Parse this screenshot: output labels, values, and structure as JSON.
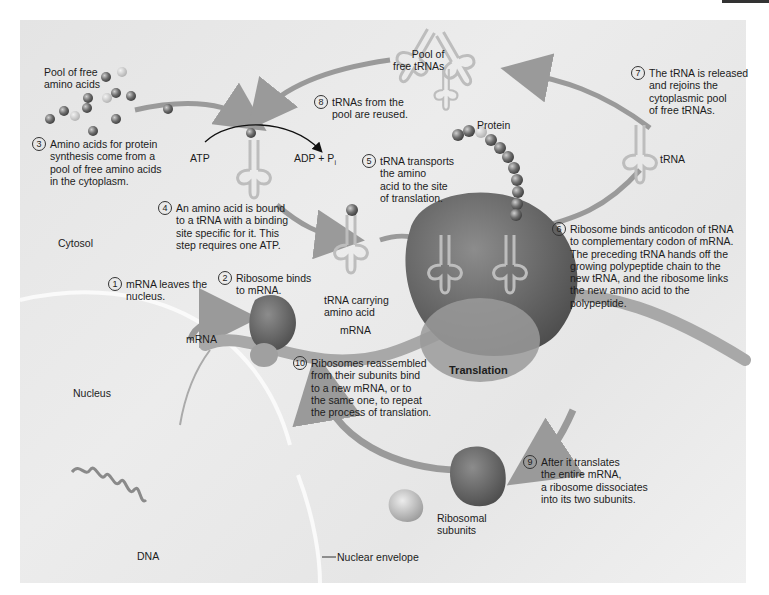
{
  "figure": {
    "title": "Translation",
    "regions": {
      "cytosol": "Cytosol",
      "nucleus": "Nucleus",
      "nuclear_envelope": "Nuclear envelope",
      "dna": "DNA"
    },
    "labels": {
      "pool_amino_acids": "Pool of free\namino acids",
      "pool_trnas": "Pool of\nfree tRNAs",
      "atp": "ATP",
      "adp_pi": "ADP + P",
      "adp_pi_sub": "i",
      "protein": "Protein",
      "trna": "tRNA",
      "trna_carrying": "tRNA carrying\namino acid",
      "mrna_left": "mRNA",
      "mrna_center": "mRNA",
      "ribosomal_subunits": "Ribosomal\nsubunits",
      "translation": "Translation"
    },
    "steps": [
      {
        "n": "1",
        "text": "mRNA leaves the\nnucleus."
      },
      {
        "n": "2",
        "text": "Ribosome binds\nto mRNA."
      },
      {
        "n": "3",
        "text": "Amino acids for protein\nsynthesis come from a\npool of free amino acids\nin the cytoplasm."
      },
      {
        "n": "4",
        "text": "An amino acid is bound\nto a tRNA with a binding\nsite specific for it.  This\nstep requires one ATP."
      },
      {
        "n": "5",
        "text": "tRNA transports\nthe amino\nacid to the site\nof translation."
      },
      {
        "n": "6",
        "text": "Ribosome binds anticodon of tRNA\nto complementary codon of mRNA.\nThe preceding tRNA hands off the\ngrowing polypeptide chain to the\nnew tRNA, and the ribosome links\nthe new amino acid to the\npolypeptide."
      },
      {
        "n": "7",
        "text": "The tRNA is released\nand rejoins the\ncytoplasmic pool\nof free tRNAs."
      },
      {
        "n": "8",
        "text": "tRNAs from the\npool are reused."
      },
      {
        "n": "9",
        "text": "After it translates\nthe entire mRNA,\na ribosome dissociates\ninto its two subunits."
      },
      {
        "n": "10",
        "text": "Ribosomes reassembled\nfrom their subunits bind\nto a new mRNA, or to\nthe same one, to repeat\nthe process of translation."
      }
    ],
    "colors": {
      "background": "#e8e8e8",
      "arrow": "#9a9a9a",
      "ribosome": "#6e6e6e",
      "mrna": "#a8a8a8",
      "trna": "#c8c8c8"
    }
  }
}
